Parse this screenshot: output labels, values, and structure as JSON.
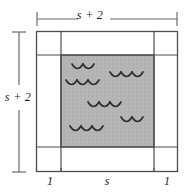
{
  "figure": {
    "type": "geometry-diagram",
    "labels": {
      "top_dimension": "s + 2",
      "left_dimension": "s + 2",
      "bottom_left_segment": "1",
      "bottom_middle_segment": "s",
      "bottom_right_segment": "1"
    },
    "colors": {
      "shaded_fill": "#b3b3b3",
      "line": "#4d4d4d",
      "dimension_line": "#6b6b6b",
      "text": "#1a1a1a",
      "background": "#ffffff"
    },
    "geometry": {
      "outer_square": {
        "x": 36,
        "y": 31,
        "width": 142,
        "height": 141
      },
      "inner_shaded_square": {
        "x": 61,
        "y": 55,
        "width": 93,
        "height": 92
      },
      "border_width_units": 1,
      "inner_side_units": "s",
      "outer_side_units": "s + 2"
    },
    "wave_marks": {
      "count": 5,
      "glyph": "scallop-wave",
      "positions": [
        {
          "x": 72,
          "y": 64,
          "arcs": 2
        },
        {
          "x": 112,
          "y": 72,
          "arcs": 3
        },
        {
          "x": 66,
          "y": 80,
          "arcs": 3
        },
        {
          "x": 88,
          "y": 102,
          "arcs": 3
        },
        {
          "x": 124,
          "y": 117,
          "arcs": 2
        },
        {
          "x": 70,
          "y": 126,
          "arcs": 3
        }
      ]
    }
  }
}
